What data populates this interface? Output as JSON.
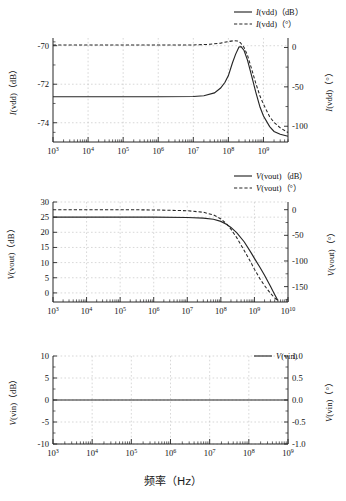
{
  "figure": {
    "x_axis_title": "频率（Hz）",
    "background": "#ffffff",
    "line_color": "#262626",
    "grid_color": "#bdbdbd"
  },
  "panels": [
    {
      "id": "panel-ivdd",
      "legend": [
        {
          "label": "I(vdd)（dB）",
          "style": "solid"
        },
        {
          "label": "I(vdd)（°）",
          "style": "dashed"
        }
      ],
      "left_axis_title": "I(vdd)（dB）",
      "right_axis_title": "I(vdd)（°）",
      "left_ticks": [
        "-70",
        "-72",
        "-74"
      ],
      "right_ticks": [
        "0",
        "-50",
        "-100"
      ],
      "x_ticks": [
        "10³",
        "10⁴",
        "10⁵",
        "10⁶",
        "10⁷",
        "10⁸",
        "10⁹"
      ],
      "x_tick_bases": [
        "10",
        "10",
        "10",
        "10",
        "10",
        "10",
        "10"
      ],
      "x_tick_exps": [
        "3",
        "4",
        "5",
        "6",
        "7",
        "8",
        "9"
      ]
    },
    {
      "id": "panel-vout",
      "legend": [
        {
          "label": "V(vout)（dB）",
          "style": "solid"
        },
        {
          "label": "V(vout)（°）",
          "style": "dashed"
        }
      ],
      "left_axis_title": "V(vout)（dB）",
      "right_axis_title": "V(vout)（°）",
      "left_ticks": [
        "30",
        "25",
        "20",
        "15",
        "10",
        "5",
        "0"
      ],
      "right_ticks": [
        "0",
        "-50",
        "-100",
        "-150"
      ],
      "x_ticks": [
        "10³",
        "10⁴",
        "10⁵",
        "10⁶",
        "10⁷",
        "10⁸",
        "10⁹",
        "10¹⁰"
      ],
      "x_tick_bases": [
        "10",
        "10",
        "10",
        "10",
        "10",
        "10",
        "10",
        "10"
      ],
      "x_tick_exps": [
        "3",
        "4",
        "5",
        "6",
        "7",
        "8",
        "9",
        "10"
      ]
    },
    {
      "id": "panel-vin",
      "legend": [
        {
          "label": "V(vin)",
          "style": "solid"
        }
      ],
      "left_axis_title": "V(vin)（dB）",
      "right_axis_title": "V(vin)（°）",
      "left_ticks": [
        "10",
        "5",
        "0",
        "-5",
        "-10"
      ],
      "right_ticks": [
        "1.0",
        "0.5",
        "0.0",
        "-0.5",
        "-1.0"
      ],
      "x_ticks": [
        "10³",
        "10⁴",
        "10⁵",
        "10⁶",
        "10⁷",
        "10⁸",
        "10⁹"
      ],
      "x_tick_bases": [
        "10",
        "10",
        "10",
        "10",
        "10",
        "10",
        "10"
      ],
      "x_tick_exps": [
        "3",
        "4",
        "5",
        "6",
        "7",
        "8",
        "9"
      ]
    }
  ],
  "chart_data": [
    {
      "type": "line",
      "id": "ivdd-bode",
      "title": "",
      "xlabel": "频率（Hz）",
      "ylabel": "I(vdd)（dB）",
      "y2label": "I(vdd)（°）",
      "xscale": "log",
      "xlim": [
        1000,
        5000000000
      ],
      "ylim": [
        -75,
        -69.6
      ],
      "y2lim": [
        -120,
        12
      ],
      "grid": true,
      "legend_position": "top-right",
      "series": [
        {
          "name": "I(vdd)（dB）",
          "style": "solid",
          "axis": "left",
          "x": [
            1000,
            10000,
            100000,
            1000000,
            10000000,
            20000000,
            40000000,
            60000000,
            80000000,
            100000000,
            130000000,
            160000000,
            200000000,
            230000000,
            280000000,
            350000000,
            450000000,
            600000000,
            800000000,
            1000000000,
            1500000000,
            2000000000,
            3000000000,
            5000000000
          ],
          "y": [
            -72.65,
            -72.65,
            -72.65,
            -72.65,
            -72.64,
            -72.6,
            -72.45,
            -72.2,
            -71.9,
            -71.55,
            -70.9,
            -70.45,
            -70.07,
            -70.05,
            -70.25,
            -70.75,
            -71.5,
            -72.4,
            -73.2,
            -73.65,
            -74.2,
            -74.45,
            -74.6,
            -74.7
          ]
        },
        {
          "name": "I(vdd)（°）",
          "style": "dashed",
          "axis": "right",
          "x": [
            1000,
            10000,
            100000,
            1000000,
            10000000,
            30000000,
            60000000,
            100000000,
            140000000,
            180000000,
            220000000,
            280000000,
            350000000,
            450000000,
            600000000,
            800000000,
            1000000000,
            1500000000,
            2000000000,
            3000000000,
            5000000000
          ],
          "y": [
            3,
            3,
            3,
            3,
            3.2,
            4,
            5.5,
            7.5,
            8.5,
            8.2,
            6,
            0,
            -10,
            -26,
            -45,
            -62,
            -72,
            -88,
            -95,
            -102,
            -108
          ]
        }
      ]
    },
    {
      "type": "line",
      "id": "vout-bode",
      "title": "",
      "xlabel": "频率（Hz）",
      "ylabel": "V(vout)（dB）",
      "y2label": "V(vout)（°）",
      "xscale": "log",
      "xlim": [
        1000,
        10000000000
      ],
      "ylim": [
        -3,
        30
      ],
      "y2lim": [
        -180,
        15
      ],
      "grid": true,
      "legend_position": "top-right",
      "series": [
        {
          "name": "V(vout)（dB）",
          "style": "solid",
          "axis": "left",
          "x": [
            1000,
            10000,
            100000,
            1000000,
            10000000,
            30000000,
            60000000,
            100000000,
            150000000,
            200000000,
            300000000,
            500000000,
            800000000,
            1000000000,
            1500000000,
            2000000000,
            3000000000,
            4000000000,
            5000000000
          ],
          "y": [
            25.0,
            25.0,
            25.0,
            25.0,
            24.9,
            24.7,
            24.3,
            23.6,
            22.6,
            21.6,
            19.8,
            16.8,
            13.2,
            11.4,
            8.2,
            5.8,
            2.2,
            -0.5,
            -2.5
          ]
        },
        {
          "name": "V(vout)（°）",
          "style": "dashed",
          "axis": "right",
          "x": [
            1000,
            10000,
            100000,
            1000000,
            10000000,
            30000000,
            60000000,
            100000000,
            150000000,
            200000000,
            300000000,
            500000000,
            800000000,
            1000000000,
            1500000000,
            2000000000,
            3000000000,
            4000000000,
            5000000000
          ],
          "y": [
            0,
            0,
            0,
            -0.5,
            -2,
            -5,
            -10,
            -18,
            -28,
            -38,
            -55,
            -80,
            -104,
            -116,
            -136,
            -148,
            -163,
            -172,
            -178
          ]
        }
      ]
    },
    {
      "type": "line",
      "id": "vin-bode",
      "title": "",
      "xlabel": "频率（Hz）",
      "ylabel": "V(vin)（dB）",
      "y2label": "V(vin)（°）",
      "xscale": "log",
      "xlim": [
        1000,
        1000000000
      ],
      "ylim": [
        -10,
        10
      ],
      "y2lim": [
        -1.0,
        1.0
      ],
      "grid": true,
      "legend_position": "top-right",
      "series": [
        {
          "name": "V(vin)",
          "style": "solid",
          "axis": "left",
          "x": [
            1000,
            1000000000
          ],
          "y": [
            0,
            0
          ]
        }
      ]
    }
  ]
}
